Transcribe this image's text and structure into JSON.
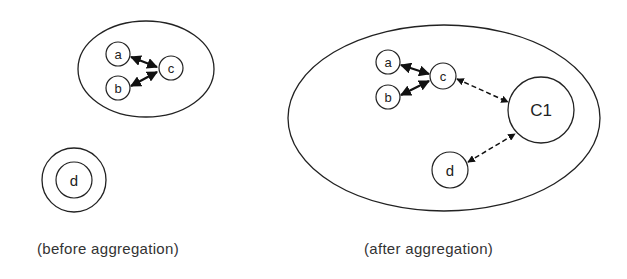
{
  "diagram": {
    "before": {
      "caption": "(before aggregation)",
      "cluster": {
        "nodes": [
          "a",
          "b",
          "c"
        ]
      },
      "isolated": {
        "node": "d"
      }
    },
    "after": {
      "caption": "(after aggregation)",
      "nodes": [
        "a",
        "b",
        "c",
        "C1",
        "d"
      ],
      "edges": [
        {
          "from": "a",
          "to": "c",
          "style": "solid"
        },
        {
          "from": "b",
          "to": "c",
          "style": "solid"
        },
        {
          "from": "c",
          "to": "C1",
          "style": "dashed"
        },
        {
          "from": "d",
          "to": "C1",
          "style": "dashed"
        }
      ]
    },
    "colors": {
      "stroke": "#222222",
      "background": "#ffffff"
    }
  }
}
